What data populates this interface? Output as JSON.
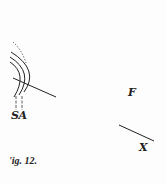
{
  "figure": {
    "caption": "'ig. 12.",
    "labels": {
      "sa": "SA",
      "f": "F",
      "x": "X"
    },
    "colors": {
      "ink": "#222222",
      "paper": "#fdfdfd"
    }
  }
}
